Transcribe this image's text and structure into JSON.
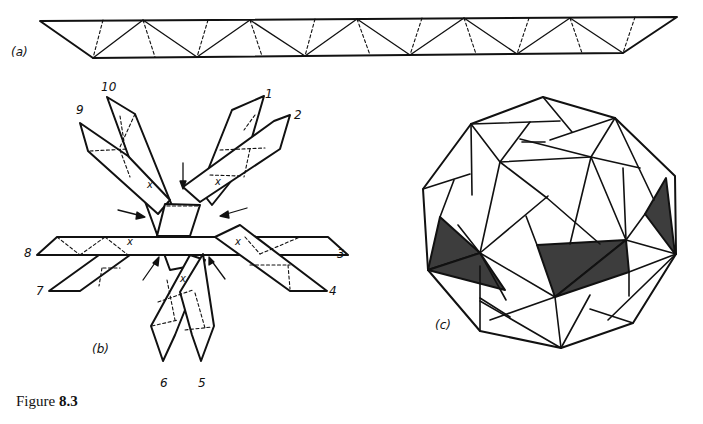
{
  "figure": {
    "caption_prefix": "Figure ",
    "caption_number": "8.3",
    "parts": {
      "a": {
        "label": "(a)",
        "description": "Strip of triangles with fold lines (solid and dashed)"
      },
      "b": {
        "label": "(b)",
        "description": "Ten woven strips with numbered ends and arrows",
        "strip_numbers": [
          "1",
          "2",
          "3",
          "4",
          "5",
          "6",
          "7",
          "8",
          "9",
          "10"
        ],
        "crossing_mark": "x"
      },
      "c": {
        "label": "(c)",
        "description": "Assembled woven polyhedron with shaded faces"
      }
    }
  },
  "colors": {
    "line": "#111111",
    "shade": "#3d3d3d",
    "background": "#ffffff"
  }
}
